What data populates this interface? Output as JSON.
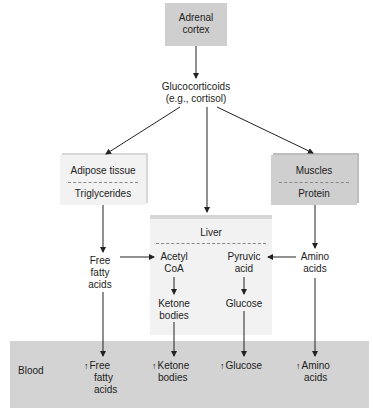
{
  "diagram": {
    "adrenal": "Adrenal cortex",
    "adrenal_l1": "Adrenal",
    "adrenal_l2": "cortex",
    "glucocorticoids_l1": "Glucocorticoids",
    "glucocorticoids_l2": "(e.g., cortisol)",
    "adipose": {
      "title": "Adipose tissue",
      "content": "Triglycerides"
    },
    "muscles": {
      "title": "Muscles",
      "content": "Protein"
    },
    "liver": {
      "title": "Liver"
    },
    "free_fatty_acids": [
      "Free",
      "fatty",
      "acids"
    ],
    "acetyl_coa": [
      "Acetyl",
      "CoA"
    ],
    "pyruvic_acid": [
      "Pyruvic",
      "acid"
    ],
    "amino_acids": [
      "Amino",
      "acids"
    ],
    "ketone_bodies": [
      "Ketone",
      "bodies"
    ],
    "glucose": "Glucose",
    "blood": {
      "label": "Blood",
      "up_arrow": "↑",
      "items": [
        [
          "Free",
          "fatty",
          "acids"
        ],
        [
          "Ketone",
          "bodies"
        ],
        [
          "Glucose"
        ],
        [
          "Amino",
          "acids"
        ]
      ]
    },
    "colors": {
      "dark_box": "#cfcfcf",
      "light_box": "#f2f2f2",
      "blood": "#d3d3d3",
      "line": "#222222"
    }
  }
}
